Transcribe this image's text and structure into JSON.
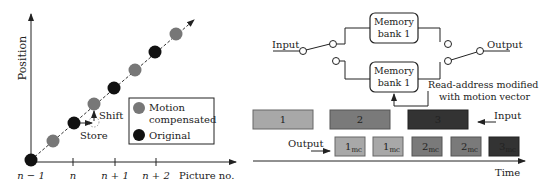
{
  "left_panel": {
    "y_axis_label": "Position",
    "x_axis_label": "Picture no.",
    "ticks": [
      "n − 1",
      "n",
      "n + 1",
      "n + 2"
    ],
    "annotations": {
      "shift": "Shift",
      "store": "Store"
    },
    "legend": {
      "motion_compensated": "Motion compensated",
      "motion_line1": "Motion",
      "motion_line2": "compensated",
      "original": "Original"
    },
    "colors": {
      "motion_compensated": "#777777",
      "original": "#111111"
    }
  },
  "right_panel": {
    "input_label": "Input",
    "output_label": "Output",
    "bank_top_line1": "Memory",
    "bank_top_line2": "bank 1",
    "bank_bottom_line1": "Memory",
    "bank_bottom_line2": "bank 1",
    "read_address_line1": "Read-address modified",
    "read_address_line2": "with motion vector",
    "timeline": {
      "input_label": "Input",
      "output_label": "Output",
      "time_label": "Time",
      "input_blocks": [
        {
          "label": "1",
          "color": "#a8a8a8"
        },
        {
          "label": "2",
          "color": "#7a7a7a"
        },
        {
          "label": "3",
          "color": "#333333"
        }
      ],
      "output_blocks": [
        {
          "label": "1",
          "sub": "mc",
          "color": "#a8a8a8"
        },
        {
          "label": "1",
          "sub": "mc",
          "color": "#a8a8a8"
        },
        {
          "label": "2",
          "sub": "mc",
          "color": "#7a7a7a"
        },
        {
          "label": "2",
          "sub": "mc",
          "color": "#7a7a7a"
        },
        {
          "label": "3",
          "sub": "mc",
          "color": "#333333"
        }
      ]
    }
  }
}
